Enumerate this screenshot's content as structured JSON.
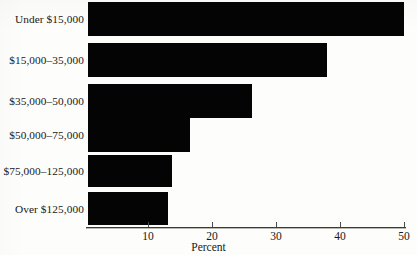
{
  "chart_data": {
    "type": "bar",
    "orientation": "horizontal",
    "title": "",
    "subtitle": "",
    "xlabel": "Percent",
    "ylabel": "",
    "categories": [
      "Under $15,000",
      "$15,000–35,000",
      "$35,000–50,000",
      "$50,000–75,000",
      "$75,000–125,000",
      "Over $125,000"
    ],
    "values": [
      49.4,
      37.3,
      25.6,
      15.9,
      13.1,
      12.5
    ],
    "xlim": [
      0,
      50
    ],
    "ylim": null,
    "xticks": [
      10,
      20,
      30,
      40,
      50
    ],
    "xtick_labels": [
      "10",
      "20",
      "30",
      "40",
      "50"
    ],
    "grid": false,
    "legend": null,
    "legend_position": "none",
    "bar_color": "#040404",
    "annotations": []
  },
  "axis": {
    "x_title": "Percent"
  }
}
